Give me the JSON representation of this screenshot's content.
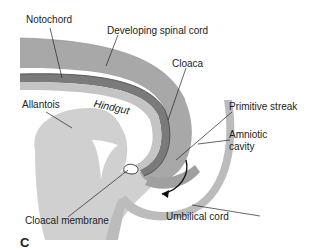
{
  "figure": {
    "panel_letter": "C",
    "labels": {
      "notochord": "Notochord",
      "spinal_cord": "Developing spinal cord",
      "cloaca": "Cloaca",
      "allantois": "Allantois",
      "hindgut": "Hindgut",
      "primitive_streak": "Primitive streak",
      "amniotic_cavity_1": "Amniotic",
      "amniotic_cavity_2": "cavity",
      "cloacal_membrane": "Cloacal membrane",
      "umbilical_cord": "Umbilical cord"
    },
    "colors": {
      "neural_tube": "#a6a6a6",
      "notochord_band": "#7d7d7d",
      "endoderm": "#c9c9c9",
      "yolk_region": "#d2d2d2",
      "amnion": "#b9b9b9",
      "line": "#222222",
      "background": "#ffffff"
    }
  }
}
